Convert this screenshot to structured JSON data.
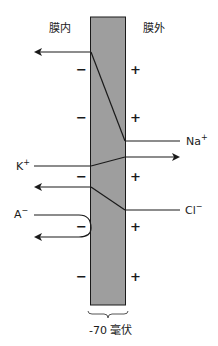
{
  "diagram": {
    "labels": {
      "inside": "膜内",
      "outside": "膜外",
      "potential": "-70 毫伏"
    },
    "ions": {
      "na": {
        "name": "Na",
        "charge": "+"
      },
      "k": {
        "name": "K",
        "charge": "+"
      },
      "cl": {
        "name": "Cl",
        "charge": "−"
      },
      "a": {
        "name": "A",
        "charge": "−"
      }
    },
    "signs": {
      "inside": [
        "−",
        "−",
        "−",
        "−",
        "−"
      ],
      "outside": [
        "+",
        "+",
        "+",
        "+",
        "+"
      ]
    },
    "colors": {
      "membrane_fill": "#9e9e9e",
      "line": "#1a1a1a",
      "background": "#ffffff"
    }
  }
}
